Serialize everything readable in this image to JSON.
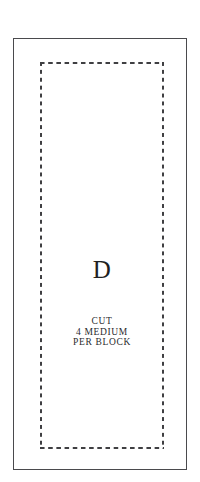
{
  "document": {
    "type": "quilting-template-pattern-piece",
    "sheet_background": "#ffffff"
  },
  "template": {
    "outer_border": {
      "name": "cutting-line",
      "style": "solid",
      "color": "#4a4a4d"
    },
    "inner_border": {
      "name": "seam-line",
      "style": "dashed",
      "color": "#3f3f42"
    },
    "piece_letter": "D",
    "instructions": [
      "CUT",
      "4 MEDIUM",
      "PER BLOCK"
    ]
  }
}
